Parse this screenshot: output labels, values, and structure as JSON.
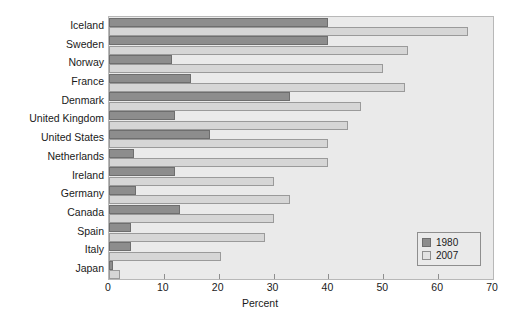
{
  "chart_data": {
    "type": "bar",
    "orientation": "horizontal",
    "title": "",
    "xlabel": "Percent",
    "ylabel": "",
    "xlim": [
      0,
      70
    ],
    "xticks": [
      0,
      10,
      20,
      30,
      40,
      50,
      60,
      70
    ],
    "grid": false,
    "legend_position": "bottom-right",
    "categories": [
      "Iceland",
      "Sweden",
      "Norway",
      "France",
      "Denmark",
      "United Kingdom",
      "United States",
      "Netherlands",
      "Ireland",
      "Germany",
      "Canada",
      "Spain",
      "Italy",
      "Japan"
    ],
    "series": [
      {
        "name": "1980",
        "color": "#8d8d8d",
        "values": [
          40,
          40,
          11.5,
          15,
          33,
          12,
          18.5,
          4.5,
          12,
          5,
          13,
          4,
          4,
          0.8
        ]
      },
      {
        "name": "2007",
        "color": "#d6d6d6",
        "values": [
          65.5,
          54.5,
          50,
          54,
          46,
          43.5,
          40,
          40,
          30,
          33,
          30,
          28.5,
          20.5,
          2
        ]
      }
    ]
  },
  "legend": {
    "items": [
      {
        "label": "1980"
      },
      {
        "label": "2007"
      }
    ]
  },
  "axis": {
    "x_title": "Percent",
    "tick_labels": [
      "0",
      "10",
      "20",
      "30",
      "40",
      "50",
      "60",
      "70"
    ]
  }
}
